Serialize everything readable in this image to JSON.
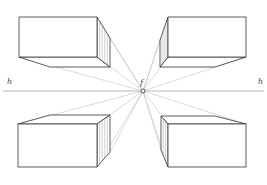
{
  "diagram": {
    "labels": {
      "horizon_left": "h",
      "horizon_right": "h",
      "vanishing_point": "f"
    },
    "colors": {
      "edge": "#333333",
      "ray": "#b5b5b5",
      "horizon": "#999999",
      "hatch": "#888888",
      "background": "#ffffff"
    },
    "horizon_y": 91,
    "vanishing_point": {
      "x": 143,
      "y": 91
    },
    "boxes": [
      {
        "name": "top-left-box",
        "front": [
          19,
          17,
          97,
          57
        ],
        "side_x": 110,
        "side_top": 38,
        "side_bottom": 67,
        "back_x": 50,
        "back_y": 67
      },
      {
        "name": "top-right-box",
        "front": [
          168,
          17,
          246,
          57
        ],
        "side_x": 160,
        "side_top": 40,
        "side_bottom": 67,
        "back_x": 215,
        "back_y": 67
      },
      {
        "name": "bottom-left-box",
        "front": [
          18,
          124,
          97,
          167
        ],
        "side_x": 110,
        "side_top": 115,
        "side_bottom": 152,
        "back_x": 50,
        "back_y": 115
      },
      {
        "name": "bottom-right-box",
        "front": [
          168,
          124,
          246,
          167
        ],
        "side_x": 161,
        "side_top": 116,
        "side_bottom": 150,
        "back_x": 215,
        "back_y": 116
      }
    ]
  }
}
